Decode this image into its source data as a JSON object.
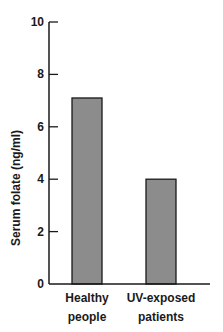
{
  "chart_data": {
    "type": "bar",
    "title": "",
    "xlabel": "",
    "ylabel": "Serum folate (ng/ml)",
    "categories": [
      "Healthy people",
      "UV-exposed patients"
    ],
    "category_lines": [
      [
        "Healthy",
        "people"
      ],
      [
        "UV-exposed",
        "patients"
      ]
    ],
    "values": [
      7.1,
      4.0
    ],
    "ylim": [
      0,
      10
    ],
    "yticks": [
      0,
      2,
      4,
      6,
      8,
      10
    ],
    "grid": false,
    "legend": null,
    "bar_color": "#8c8c8c",
    "bar_edge_color": "#1a1a1a"
  }
}
